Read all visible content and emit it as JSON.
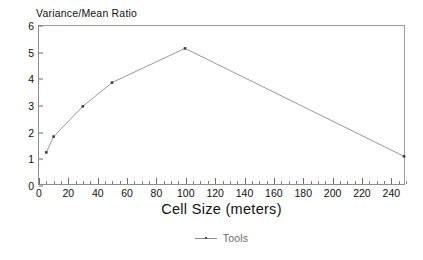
{
  "chart_data": {
    "type": "line",
    "title": "",
    "xlabel": "Cell Size (meters)",
    "ylabel": "Variance/Mean Ratio",
    "xlim": [
      0,
      250
    ],
    "ylim": [
      0,
      6
    ],
    "grid": false,
    "legend_position": "bottom-center",
    "x_major_tick_step": 20,
    "x_minor_tick_step": 5,
    "y_tick_step": 1,
    "x_tick_labels": [
      "0",
      "20",
      "40",
      "60",
      "80",
      "100",
      "120",
      "140",
      "160",
      "180",
      "200",
      "220",
      "240"
    ],
    "x_tick_values": [
      0,
      20,
      40,
      60,
      80,
      100,
      120,
      140,
      160,
      180,
      200,
      220,
      240
    ],
    "y_tick_labels": [
      "0",
      "1",
      "2",
      "3",
      "4",
      "5",
      "6"
    ],
    "y_tick_values": [
      0,
      1,
      2,
      3,
      4,
      5,
      6
    ],
    "series": [
      {
        "name": "Tools",
        "color": "#8a8a8a",
        "marker_color": "#3c3c3c",
        "x": [
          5,
          10,
          30,
          50,
          100,
          250
        ],
        "values": [
          1.2,
          1.8,
          2.95,
          3.85,
          5.15,
          1.05
        ]
      }
    ],
    "legend": [
      "Tools"
    ]
  },
  "legend": {
    "entry_label": "Tools",
    "marker_icon": "line-marker-icon"
  }
}
